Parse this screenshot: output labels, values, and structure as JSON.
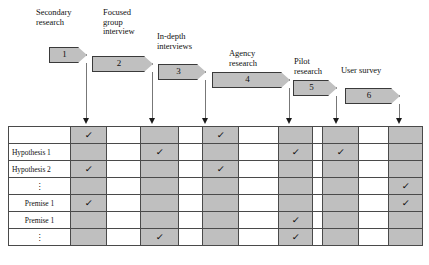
{
  "diagram": {
    "colors": {
      "shape_fill": "#c0c0c0",
      "shape_border": "#3a3a3a",
      "cell_shaded": "#bfbfbf",
      "cell_plain": "#ffffff",
      "grid_line": "#4a4a4a",
      "arrow": "#1a1a1a",
      "connector": "#777777"
    },
    "stages": [
      {
        "number": "1",
        "label": "Secondary\nresearch",
        "x": 49,
        "y": 47,
        "width": 38,
        "label_x": 36,
        "label_y": 8,
        "label_align": "left",
        "arrow_x": 86,
        "arrow_top": 63
      },
      {
        "number": "2",
        "label": "Focused\ngroup\ninterview",
        "x": 92,
        "y": 56,
        "width": 61,
        "label_x": 103,
        "label_y": 8,
        "label_align": "left",
        "arrow_x": 152,
        "arrow_top": 72
      },
      {
        "number": "3",
        "label": "In-depth\ninterviews",
        "x": 158,
        "y": 64,
        "width": 48,
        "label_x": 157,
        "label_y": 32,
        "label_align": "left",
        "arrow_x": 205,
        "arrow_top": 80
      },
      {
        "number": "4",
        "label": "Agency\nresearch",
        "x": 212,
        "y": 72,
        "width": 78,
        "label_x": 229,
        "label_y": 49,
        "label_align": "left",
        "arrow_x": 289,
        "arrow_top": 88
      },
      {
        "number": "5",
        "label": "Pilot\nresearch",
        "x": 293,
        "y": 80,
        "width": 44,
        "label_x": 294,
        "label_y": 57,
        "label_align": "left",
        "arrow_x": 336,
        "arrow_top": 96
      },
      {
        "number": "6",
        "label": "User survey",
        "x": 345,
        "y": 88,
        "width": 55,
        "label_x": 341,
        "label_y": 66,
        "label_align": "left",
        "arrow_x": 399,
        "arrow_top": 104
      }
    ],
    "table": {
      "x": 8,
      "y": 126,
      "width": 414,
      "label_col_width": 62,
      "row_height": 16,
      "column_widths": [
        62,
        36,
        34,
        38,
        24,
        36,
        40,
        34,
        10,
        36,
        30,
        34
      ],
      "column_shading": [
        "plain",
        "shaded",
        "plain",
        "shaded",
        "plain",
        "shaded",
        "plain",
        "shaded",
        "plain",
        "shaded",
        "plain",
        "shaded"
      ],
      "rows": [
        {
          "label": "",
          "label_style": "center",
          "checks": [
            1,
            5
          ]
        },
        {
          "label": "Hypothesis 1",
          "label_style": "left",
          "checks": [
            3,
            7,
            9
          ]
        },
        {
          "label": "Hypothesis 2",
          "label_style": "left",
          "checks": [
            1,
            5
          ]
        },
        {
          "label": "⋮",
          "label_style": "center",
          "checks": [
            11
          ]
        },
        {
          "label": "Premise 1",
          "label_style": "center",
          "checks": [
            1,
            11
          ]
        },
        {
          "label": "Premise 1",
          "label_style": "center",
          "checks": [
            7
          ]
        },
        {
          "label": "⋮",
          "label_style": "center",
          "checks": [
            3,
            7
          ]
        }
      ],
      "check_glyph": "✓",
      "dots_glyph": "⋮"
    }
  }
}
